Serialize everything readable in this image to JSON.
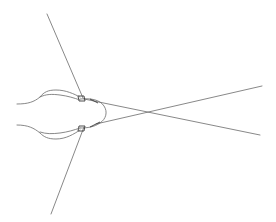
{
  "diagram": {
    "type": "line-drawing",
    "stroke_color": "#6a6a6a",
    "background": "#ffffff",
    "lines": [
      {
        "name": "upper-left-rod",
        "x1": 47,
        "y1": 14,
        "x2": 82,
        "y2": 97
      },
      {
        "name": "lower-left-rod",
        "x1": 51,
        "y1": 214,
        "x2": 83,
        "y2": 128
      },
      {
        "name": "crossing-line-a",
        "x1": 82,
        "y1": 100,
        "x2": 262,
        "y2": 86
      },
      {
        "name": "crossing-line-b",
        "x1": 82,
        "y1": 100,
        "x2": 260,
        "y2": 135
      }
    ],
    "crossing_point": {
      "x": 142,
      "y": 113
    }
  }
}
